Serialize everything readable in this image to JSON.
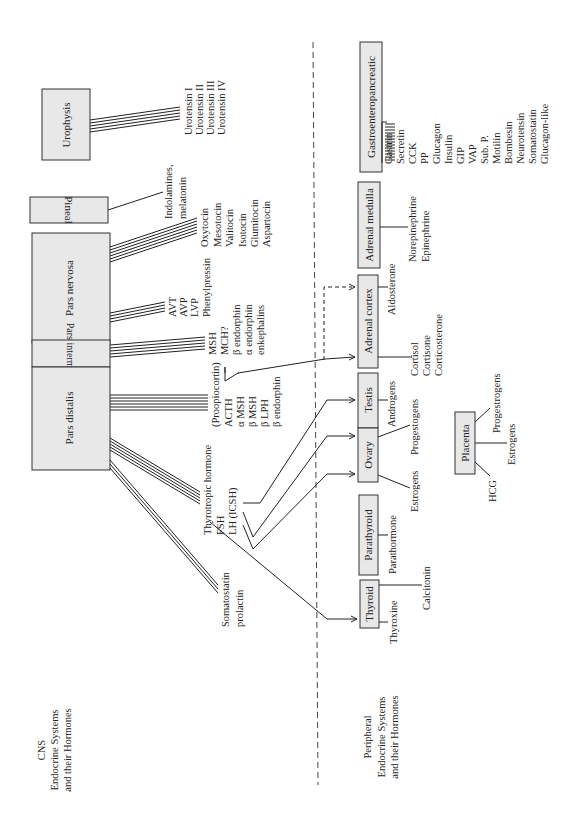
{
  "sections": {
    "cns": [
      "CNS",
      "Endocrine Systems",
      "and their Hormones"
    ],
    "peripheral": [
      "Peripheral",
      "Endocrine Systems",
      "and their Hormones"
    ]
  },
  "cns_glands": {
    "urophysis": "Urophysis",
    "pineal": "Pineal",
    "pars_nervosa": "Pars nervosa",
    "pars_intermedia": "Pars intermedia",
    "pars_distalis": "Pars distalis"
  },
  "cns_hormones": {
    "urophysis": [
      "Urotensin I",
      "Urotensin II",
      "Urotensin III",
      "Urotensin IV"
    ],
    "pineal": [
      "Indolamines,",
      "melatonin"
    ],
    "pars_nervosa_a": [
      "Oxytocin",
      "Mesotocin",
      "Valitocin",
      "Isotocin",
      "Glumitocin",
      "Aspartocin"
    ],
    "pars_nervosa_b": [
      "AVT",
      "AVP",
      "LVP",
      "Phenylpressin"
    ],
    "pars_intermedia": [
      "MSH",
      "MCH?",
      "β endorphin",
      "α endorphin",
      "enkephalins"
    ],
    "pars_distalis_pomc": [
      "(Proopiocortin)",
      "ACTH",
      "α MSH",
      "β MSH",
      "β LPH",
      "β endorphin"
    ],
    "pars_distalis_gonad": [
      "Thyrotropic hormone",
      "FSH",
      "LH (ICSH)"
    ],
    "pars_distalis_other": [
      "Somatostatin",
      "prolactin"
    ]
  },
  "peripheral_glands": {
    "gastro": "Gastroenteropancreatic",
    "adrenal_medulla": "Adrenal medulla",
    "adrenal_cortex": "Adrenal cortex",
    "testis": "Testis",
    "ovary": "Ovary",
    "parathyroid": "Parathyroid",
    "thyroid": "Thyroid",
    "placenta": "Placenta"
  },
  "peripheral_hormones": {
    "gastro": [
      "Gastrin",
      "Secretin",
      "CCK",
      "PP",
      "Glucagon",
      "Insulin",
      "GIP",
      "VAP",
      "Sub. P.",
      "Motilin",
      "Bombesin",
      "Neurotensin",
      "Somatostatin",
      "Glucagon-like"
    ],
    "adrenal_medulla": [
      "Norepinephrine",
      "Epinephrine"
    ],
    "adrenal_cortex_a": [
      "Aldosterone"
    ],
    "adrenal_cortex_b": [
      "Cortisol",
      "Cortisone",
      "Corticosterone"
    ],
    "testis": [
      "Androgens"
    ],
    "ovary_a": [
      "Progestogens"
    ],
    "ovary_b": [
      "Estrogens"
    ],
    "parathyroid": [
      "Parathormone"
    ],
    "thyroid_a": [
      "Calcitonin"
    ],
    "thyroid_b": [
      "Thyroxine"
    ],
    "placenta_a": [
      "Progestrogens"
    ],
    "placenta_b": [
      "Estrogens"
    ],
    "placenta_c": [
      "HCG"
    ]
  }
}
